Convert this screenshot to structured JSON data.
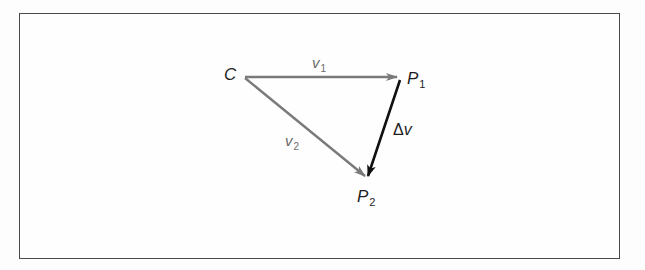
{
  "diagram": {
    "points": {
      "C": {
        "label": "C",
        "x": 243,
        "y": 77
      },
      "P1": {
        "label": "P",
        "sub": "1",
        "x": 399,
        "y": 77
      },
      "P2": {
        "label": "P",
        "sub": "2",
        "x": 367,
        "y": 178
      }
    },
    "vectors": [
      {
        "name": "v1",
        "label": "v",
        "sub": "1",
        "from": "C",
        "to": "P1",
        "color": "#7a7a7a"
      },
      {
        "name": "v2",
        "label": "v",
        "sub": "2",
        "from": "C",
        "to": "P2",
        "color": "#7a7a7a"
      },
      {
        "name": "delta-v",
        "label_symbol": "Δ",
        "label": "v",
        "from": "P1",
        "to": "P2",
        "color": "#111111"
      }
    ],
    "colors": {
      "gray_vector": "#7a7a7a",
      "black_vector": "#111111",
      "frame": "#4a4a4a"
    }
  }
}
